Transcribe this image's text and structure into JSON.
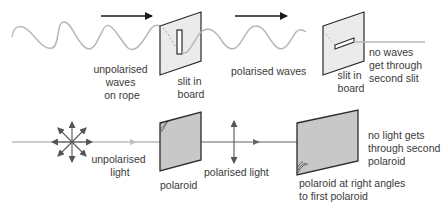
{
  "colors": {
    "rope": "#b8b8b8",
    "ray": "#9a9a9a",
    "arrow": "#1a1a1a",
    "board_fill": "#ebebeb",
    "polaroid_fill": "#c8c8c8",
    "outline": "#2a2a2a",
    "text": "#3a3a3a"
  },
  "top": {
    "label_unpolarised": [
      "unpolarised",
      "waves",
      "on rope"
    ],
    "label_slit1": [
      "slit in",
      "board"
    ],
    "label_polarised": "polarised waves",
    "label_slit2": [
      "slit in",
      "board"
    ],
    "label_result": [
      "no waves",
      "get through",
      "second slit"
    ]
  },
  "bottom": {
    "label_unpolarised": [
      "unpolarised",
      "light"
    ],
    "label_polaroid1": "polaroid",
    "label_polarised": "polarised light",
    "label_polaroid2": [
      "polaroid at right angles",
      "to first polaroid"
    ],
    "label_result": [
      "no light gets",
      "through second",
      "polaroid"
    ]
  }
}
